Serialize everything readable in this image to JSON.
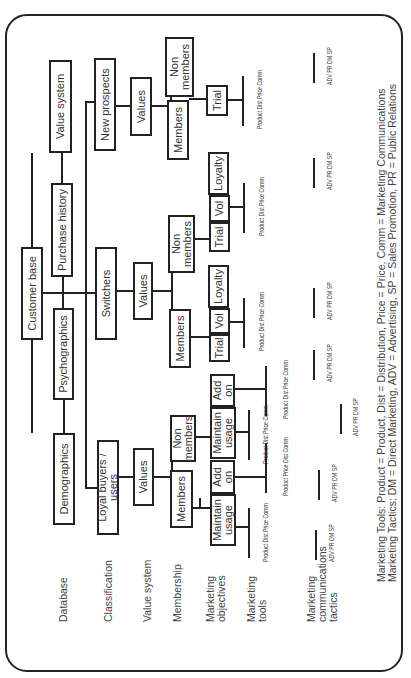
{
  "row_labels": {
    "database": "Database",
    "classification": "Classification",
    "value_system": "Value system",
    "membership": "Membership",
    "marketing_objectives_1": "Marketing",
    "marketing_objectives_2": "objectives",
    "marketing_tools_1": "Marketing",
    "marketing_tools_2": "tools",
    "mct_1": "Marketing",
    "mct_2": "communications",
    "mct_3": "tactics"
  },
  "nodes": {
    "customer_base": "Customer base",
    "demographics": "Demographics",
    "psychographics": "Psychographics",
    "purchase_history": "Purchase history",
    "value_system": "Value system",
    "loyal_buyers": "Loyal buyers / users",
    "switchers": "Switchers",
    "new_prospects": "New prospects",
    "values": "Values",
    "members": "Members",
    "non": "Non",
    "members_lc": "members",
    "maintain": "Maintain",
    "usage": "usage",
    "add": "Add",
    "on": "on",
    "trial": "Trial",
    "vol": "Vol",
    "loyalty": "Loyalty"
  },
  "tools": {
    "product": "Product",
    "dist": "Dist",
    "price": "Price",
    "comm": "Comm"
  },
  "tactics": {
    "adv": "ADV",
    "pr": "PR",
    "dm": "DM",
    "sp": "SP"
  },
  "legend": {
    "line1": "Marketing Tools:  Product = Product, Dist = Distribution, Price = Price, Comm = Marketing Communications",
    "line2": "Marketing Tactics:  DM = Direct Marketing, ADV = Advertising, SP = Sales Promotion, PR = Public Relations"
  }
}
